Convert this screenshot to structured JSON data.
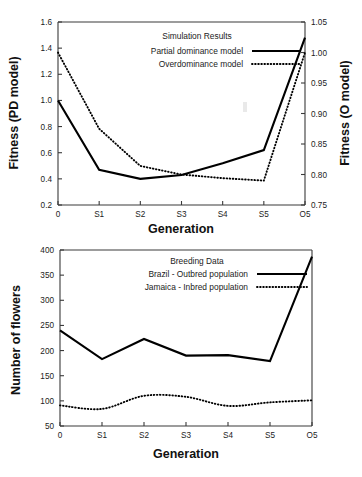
{
  "figure": {
    "background": "#ffffff",
    "ink_color": "#000000",
    "axis_color": "#3a3a3a"
  },
  "chart_data": [
    {
      "id": "simulation-results",
      "type": "line",
      "title": "Simulation Results",
      "xlabel": "Generation",
      "ylabel": "Fitness (PD model)",
      "y2label": "Fitness (O model)",
      "categories": [
        "0",
        "S1",
        "S2",
        "S3",
        "S4",
        "S5",
        "O5"
      ],
      "ylim": [
        0.2,
        1.6
      ],
      "yticks": [
        "0.2",
        "0.4",
        "0.6",
        "0.8",
        "1.0",
        "1.2",
        "1.4",
        "1.6"
      ],
      "ytick_values": [
        0.2,
        0.4,
        0.6,
        0.8,
        1.0,
        1.2,
        1.4,
        1.6
      ],
      "y2lim": [
        0.75,
        1.05
      ],
      "y2ticks": [
        "0.75",
        "0.80",
        "0.85",
        "0.90",
        "0.95",
        "1.00",
        "1.05"
      ],
      "y2tick_values": [
        0.75,
        0.8,
        0.85,
        0.9,
        0.95,
        1.0,
        1.05
      ],
      "grid": false,
      "legend_position": "top-center-inside",
      "series": [
        {
          "name": "Partial dominance model",
          "style": "solid",
          "axis": "left",
          "values": [
            1.0,
            0.47,
            0.4,
            0.43,
            0.52,
            0.62,
            1.48
          ]
        },
        {
          "name": "Overdominance model",
          "style": "dotted",
          "axis": "right",
          "values": [
            1.0,
            0.875,
            0.814,
            0.8,
            0.794,
            0.79,
            1.0
          ]
        }
      ]
    },
    {
      "id": "breeding-data",
      "type": "line",
      "title": "Breeding Data",
      "xlabel": "Generation",
      "ylabel": "Number of flowers",
      "categories": [
        "0",
        "S1",
        "S2",
        "S3",
        "S4",
        "S5",
        "O5"
      ],
      "ylim": [
        50,
        400
      ],
      "yticks": [
        "50",
        "100",
        "150",
        "200",
        "250",
        "300",
        "350",
        "400"
      ],
      "ytick_values": [
        50,
        100,
        150,
        200,
        250,
        300,
        350,
        400
      ],
      "grid": false,
      "legend_position": "top-center-inside",
      "series": [
        {
          "name": "Brazil - Outbred population",
          "style": "solid",
          "axis": "left",
          "values": [
            240,
            183,
            223,
            190,
            191,
            179,
            387
          ]
        },
        {
          "name": "Jamaica - Inbred population",
          "style": "dotted",
          "axis": "left",
          "values": [
            91,
            84,
            110,
            108,
            90,
            97,
            101
          ]
        }
      ]
    }
  ]
}
